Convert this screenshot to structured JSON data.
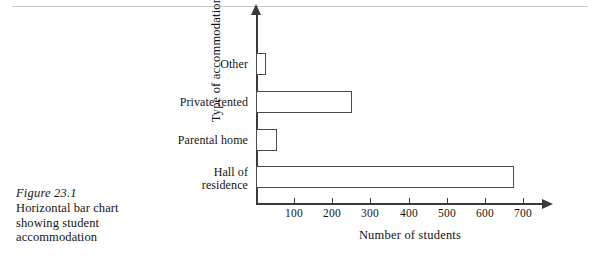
{
  "figure": {
    "number_label": "Figure 23.1",
    "description_line1": "Horizontal bar chart",
    "description_line2": "showing student",
    "description_line3": "accommodation"
  },
  "chart_data": {
    "type": "bar",
    "orientation": "horizontal",
    "title": "",
    "xlabel": "Number of students",
    "ylabel": "Type of accommodation",
    "categories": [
      "Hall of residence",
      "Parental home",
      "Private rented",
      "Other"
    ],
    "category_labels": [
      {
        "line1": "Hall of",
        "line2": "residence"
      },
      {
        "line1": "Parental home",
        "line2": ""
      },
      {
        "line1": "Private rented",
        "line2": ""
      },
      {
        "line1": "Other",
        "line2": ""
      }
    ],
    "values": [
      675,
      55,
      250,
      25
    ],
    "xlim": [
      0,
      750
    ],
    "xticks": [
      100,
      200,
      300,
      400,
      500,
      600,
      700
    ],
    "xtick_labels": [
      "100",
      "200",
      "300",
      "400",
      "500",
      "600",
      "700"
    ],
    "grid": false,
    "legend": null,
    "bar_fill": "#ffffff",
    "bar_stroke": "#4a4a4a",
    "axis_color": "#3a3a3a"
  }
}
